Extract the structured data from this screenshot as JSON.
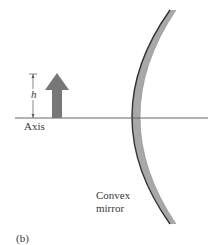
{
  "figure": {
    "panel_label": "(b)",
    "axis_label": "Axis",
    "height_label": "h",
    "mirror_label_line1": "Convex",
    "mirror_label_line2": "mirror"
  },
  "colors": {
    "background": "#ffffff",
    "line": "#555555",
    "arrow_fill": "#777777",
    "mirror_fill": "#a8a8a8",
    "mirror_edge": "#333333",
    "text": "#3a3a3a"
  },
  "elements": {
    "object_arrow": {
      "base_y": 118,
      "tip_y": 73,
      "shaft_x": [
        52,
        62
      ],
      "head_x": [
        45,
        69
      ],
      "head_base_y": 90
    },
    "optical_axis": {
      "y": 118,
      "x_start": 15,
      "x_end": 208
    },
    "height_marker": {
      "x": 33,
      "y_top": 74,
      "y_bottom": 118
    },
    "convex_mirror": {
      "top": [
        172,
        10
      ],
      "axis_crossing_x": 133,
      "bottom": [
        170,
        224
      ]
    }
  }
}
